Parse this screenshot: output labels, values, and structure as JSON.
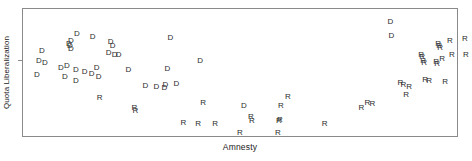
{
  "chart_data": {
    "type": "scatter",
    "title": "",
    "subtitle": "",
    "xlabel": "Amnesty",
    "ylabel": "Quota Liberalization",
    "xlim": [
      0,
      1
    ],
    "ylim": [
      0,
      1
    ],
    "grid": false,
    "legend_position": "none",
    "axis_ticks": {
      "x_tick_labels": [],
      "y_tick_labels": [],
      "y_tick_marks": [
        0.595
      ]
    },
    "marker_style": "text-glyph",
    "series": [
      {
        "name": "D",
        "label": "D",
        "marker": "D",
        "color": "#2b2b2b",
        "count": 36,
        "points": [
          {
            "x": 0.0436,
            "y": 0.6667,
            "label": "D"
          },
          {
            "x": 0.0367,
            "y": 0.5891,
            "label": "D"
          },
          {
            "x": 0.0505,
            "y": 0.5736,
            "label": "D"
          },
          {
            "x": 0.0321,
            "y": 0.4806,
            "label": "D"
          },
          {
            "x": 0.1239,
            "y": 0.8062,
            "label": "D"
          },
          {
            "x": 0.1606,
            "y": 0.7829,
            "label": "D"
          },
          {
            "x": 0.1101,
            "y": 0.7519,
            "label": "D"
          },
          {
            "x": 0.1055,
            "y": 0.7209,
            "label": "D"
          },
          {
            "x": 0.1078,
            "y": 0.7055,
            "label": "D"
          },
          {
            "x": 0.1101,
            "y": 0.6822,
            "label": "D"
          },
          {
            "x": 0.0872,
            "y": 0.5349,
            "label": "D"
          },
          {
            "x": 0.1009,
            "y": 0.5504,
            "label": "D"
          },
          {
            "x": 0.0963,
            "y": 0.4651,
            "label": "D"
          },
          {
            "x": 0.1216,
            "y": 0.5194,
            "label": "D"
          },
          {
            "x": 0.1216,
            "y": 0.4341,
            "label": "D"
          },
          {
            "x": 0.1422,
            "y": 0.5039,
            "label": "D"
          },
          {
            "x": 0.1583,
            "y": 0.4884,
            "label": "D"
          },
          {
            "x": 0.1697,
            "y": 0.5349,
            "label": "D"
          },
          {
            "x": 0.1743,
            "y": 0.4651,
            "label": "D"
          },
          {
            "x": 0.2018,
            "y": 0.7364,
            "label": "D"
          },
          {
            "x": 0.2064,
            "y": 0.7054,
            "label": "D"
          },
          {
            "x": 0.1972,
            "y": 0.6512,
            "label": "D"
          },
          {
            "x": 0.211,
            "y": 0.6357,
            "label": "D"
          },
          {
            "x": 0.2202,
            "y": 0.6357,
            "label": "D"
          },
          {
            "x": 0.2431,
            "y": 0.5194,
            "label": "D"
          },
          {
            "x": 0.2821,
            "y": 0.3953,
            "label": "D"
          },
          {
            "x": 0.3073,
            "y": 0.3876,
            "label": "D"
          },
          {
            "x": 0.3257,
            "y": 0.3798,
            "label": "D"
          },
          {
            "x": 0.328,
            "y": 0.4031,
            "label": "D"
          },
          {
            "x": 0.3326,
            "y": 0.5271,
            "label": "D"
          },
          {
            "x": 0.3394,
            "y": 0.7752,
            "label": "D"
          },
          {
            "x": 0.3532,
            "y": 0.4109,
            "label": "D"
          },
          {
            "x": 0.4083,
            "y": 0.5891,
            "label": "D"
          },
          {
            "x": 0.5092,
            "y": 0.2326,
            "label": "D"
          },
          {
            "x": 0.8463,
            "y": 0.8992,
            "label": "D"
          },
          {
            "x": 0.8486,
            "y": 0.7907,
            "label": "D"
          }
        ]
      },
      {
        "name": "R",
        "label": "R",
        "marker": "R",
        "color": "#2b2b2b",
        "count": 40,
        "points": [
          {
            "x": 0.1766,
            "y": 0.3023,
            "label": "R"
          },
          {
            "x": 0.2569,
            "y": 0.2171,
            "label": "R"
          },
          {
            "x": 0.2592,
            "y": 0.1938,
            "label": "R"
          },
          {
            "x": 0.3693,
            "y": 0.1008,
            "label": "R"
          },
          {
            "x": 0.4037,
            "y": 0.093,
            "label": "R"
          },
          {
            "x": 0.4151,
            "y": 0.2636,
            "label": "R"
          },
          {
            "x": 0.4427,
            "y": 0.093,
            "label": "R"
          },
          {
            "x": 0.5,
            "y": 0.0233,
            "label": "R"
          },
          {
            "x": 0.5252,
            "y": 0.1473,
            "label": "R"
          },
          {
            "x": 0.5275,
            "y": 0.1163,
            "label": "R"
          },
          {
            "x": 0.5872,
            "y": 0.0233,
            "label": "R"
          },
          {
            "x": 0.5894,
            "y": 0.1163,
            "label": "R"
          },
          {
            "x": 0.5917,
            "y": 0.1241,
            "label": "R"
          },
          {
            "x": 0.594,
            "y": 0.2326,
            "label": "R"
          },
          {
            "x": 0.6101,
            "y": 0.3101,
            "label": "R"
          },
          {
            "x": 0.6949,
            "y": 0.093,
            "label": "R"
          },
          {
            "x": 0.7798,
            "y": 0.2171,
            "label": "R"
          },
          {
            "x": 0.7936,
            "y": 0.2636,
            "label": "R"
          },
          {
            "x": 0.805,
            "y": 0.2558,
            "label": "R"
          },
          {
            "x": 0.8693,
            "y": 0.4186,
            "label": "R"
          },
          {
            "x": 0.8762,
            "y": 0.4031,
            "label": "R"
          },
          {
            "x": 0.883,
            "y": 0.3256,
            "label": "R"
          },
          {
            "x": 0.89,
            "y": 0.3876,
            "label": "R"
          },
          {
            "x": 0.9174,
            "y": 0.6357,
            "label": "R"
          },
          {
            "x": 0.9197,
            "y": 0.6202,
            "label": "R"
          },
          {
            "x": 0.922,
            "y": 0.5891,
            "label": "R"
          },
          {
            "x": 0.9243,
            "y": 0.5736,
            "label": "R"
          },
          {
            "x": 0.9266,
            "y": 0.4419,
            "label": "R"
          },
          {
            "x": 0.9358,
            "y": 0.4341,
            "label": "R"
          },
          {
            "x": 0.9519,
            "y": 0.5814,
            "label": "R"
          },
          {
            "x": 0.9541,
            "y": 0.5659,
            "label": "R"
          },
          {
            "x": 0.9564,
            "y": 0.7209,
            "label": "R"
          },
          {
            "x": 0.9587,
            "y": 0.7054,
            "label": "R"
          },
          {
            "x": 0.961,
            "y": 0.6899,
            "label": "R"
          },
          {
            "x": 0.9656,
            "y": 0.6047,
            "label": "R"
          },
          {
            "x": 0.9725,
            "y": 0.4264,
            "label": "R"
          },
          {
            "x": 0.9839,
            "y": 0.7519,
            "label": "R"
          },
          {
            "x": 0.9885,
            "y": 0.6357,
            "label": "R"
          },
          {
            "x": 1.0206,
            "y": 0.7597,
            "label": "R"
          },
          {
            "x": 1.0229,
            "y": 0.6279,
            "label": "R"
          }
        ]
      }
    ]
  },
  "axes": {
    "x_label": "Amnesty",
    "y_label": "Quota Liberalization"
  }
}
